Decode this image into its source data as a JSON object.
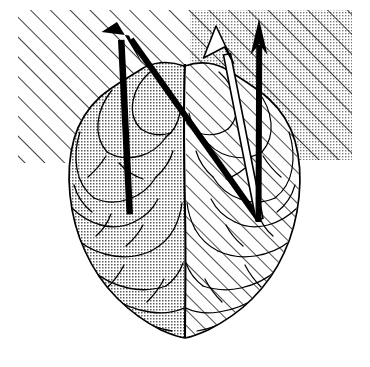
{
  "figure": {
    "caption": "",
    "width": 370,
    "height": 367,
    "background_color": "#ffffff",
    "ink_color": "#000000"
  },
  "background_regions": [
    {
      "name": "left-hatched-field",
      "fill_style": "diagonal-hatch",
      "hatch_angle_deg": 45,
      "hatch_spacing_px": 14,
      "stipple": false,
      "rect": {
        "x": 18,
        "y": 10,
        "width": 172,
        "height": 153
      }
    },
    {
      "name": "right-stippled-hatched-field",
      "fill_style": "stipple-plus-diagonal-hatch",
      "hatch_angle_deg": 45,
      "hatch_spacing_px": 14,
      "stipple": true,
      "rect": {
        "x": 190,
        "y": 10,
        "width": 162,
        "height": 150
      }
    }
  ],
  "brain": {
    "name": "brain-superior-view",
    "outline_color": "#000000",
    "outline_width_px": 1.6,
    "midline_label": "interhemispheric-fissure",
    "hemispheres": [
      {
        "name": "left-hemisphere",
        "fill_style": "stipple",
        "fill_label": "dotted / stippled texture",
        "tint": "#cfcfcf"
      },
      {
        "name": "right-hemisphere",
        "fill_style": "diagonal-hatch",
        "fill_label": "diagonal line hatching",
        "hatch_angle_deg": 45,
        "hatch_spacing_px": 11,
        "tint": "#ffffff"
      }
    ]
  },
  "arrows": [
    {
      "name": "arrow-left-solid",
      "style": "solid-filled",
      "color": "#000000",
      "thickness_px": 6.5,
      "tail": {
        "x": 129,
        "y": 214
      },
      "tip": {
        "x": 117,
        "y": 22
      },
      "note": "thick solid arrow from left hemisphere pointing up-left"
    },
    {
      "name": "arrow-diagonal-solid",
      "style": "solid-filled",
      "color": "#000000",
      "thickness_px": 6.5,
      "tail": {
        "x": 258,
        "y": 220
      },
      "tip": {
        "x": 119,
        "y": 24
      },
      "note": "thick solid arrow from right hemisphere pointing up-left"
    },
    {
      "name": "arrow-outlined-diagonal",
      "style": "outlined-hollow",
      "color": "#000000",
      "fill": "#ffffff",
      "thickness_px": 9,
      "tail": {
        "x": 258,
        "y": 219
      },
      "tip": {
        "x": 216,
        "y": 26
      },
      "note": "hollow white arrow from right hemisphere pointing up and slightly left"
    },
    {
      "name": "arrow-vertical-solid",
      "style": "solid-filled",
      "color": "#000000",
      "thickness_px": 6,
      "tail": {
        "x": 258,
        "y": 222
      },
      "tip": {
        "x": 259,
        "y": 19
      },
      "note": "thick solid vertical arrow from right hemisphere pointing straight up"
    }
  ],
  "labels": []
}
